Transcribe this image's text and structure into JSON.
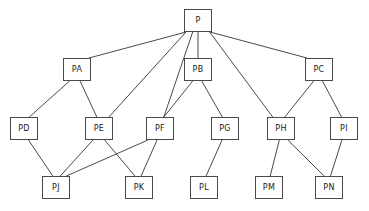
{
  "diagram": {
    "type": "node-link-graph",
    "title": "",
    "canvas": {
      "width": 369,
      "height": 211
    },
    "style": {
      "background_color": "#ffffff",
      "node_fill": "#ffffff",
      "node_stroke": "#4a4a4a",
      "edge_stroke": "#4a4a4a",
      "label_color": "#1a1a1a"
    },
    "nodes": [
      {
        "id": "P",
        "label": "P",
        "x": 184,
        "y": 9,
        "w": 28,
        "h": 23,
        "level": 0
      },
      {
        "id": "PA",
        "label": "PA",
        "x": 63,
        "y": 58,
        "w": 28,
        "h": 23,
        "level": 1
      },
      {
        "id": "PB",
        "label": "PB",
        "x": 184,
        "y": 58,
        "w": 28,
        "h": 23,
        "level": 1
      },
      {
        "id": "PC",
        "label": "PC",
        "x": 305,
        "y": 58,
        "w": 28,
        "h": 23,
        "level": 1
      },
      {
        "id": "PD",
        "label": "PD",
        "x": 10,
        "y": 117,
        "w": 28,
        "h": 23,
        "level": 2
      },
      {
        "id": "PE",
        "label": "PE",
        "x": 85,
        "y": 117,
        "w": 28,
        "h": 23,
        "level": 2
      },
      {
        "id": "PF",
        "label": "PF",
        "x": 146,
        "y": 117,
        "w": 28,
        "h": 23,
        "level": 2
      },
      {
        "id": "PG",
        "label": "PG",
        "x": 211,
        "y": 117,
        "w": 28,
        "h": 23,
        "level": 2
      },
      {
        "id": "PH",
        "label": "PH",
        "x": 267,
        "y": 117,
        "w": 28,
        "h": 23,
        "level": 2
      },
      {
        "id": "PI",
        "label": "PI",
        "x": 330,
        "y": 117,
        "w": 28,
        "h": 23,
        "level": 2
      },
      {
        "id": "PJ",
        "label": "PJ",
        "x": 42,
        "y": 176,
        "w": 28,
        "h": 23,
        "level": 3
      },
      {
        "id": "PK",
        "label": "PK",
        "x": 125,
        "y": 176,
        "w": 28,
        "h": 23,
        "level": 3
      },
      {
        "id": "PL",
        "label": "PL",
        "x": 190,
        "y": 176,
        "w": 28,
        "h": 23,
        "level": 3
      },
      {
        "id": "PM",
        "label": "PM",
        "x": 255,
        "y": 176,
        "w": 28,
        "h": 23,
        "level": 3
      },
      {
        "id": "PN",
        "label": "PN",
        "x": 315,
        "y": 176,
        "w": 28,
        "h": 23,
        "level": 3
      }
    ],
    "edges": [
      {
        "from": "P",
        "to": "PA"
      },
      {
        "from": "P",
        "to": "PE"
      },
      {
        "from": "P",
        "to": "PF"
      },
      {
        "from": "P",
        "to": "PB"
      },
      {
        "from": "P",
        "to": "PH"
      },
      {
        "from": "P",
        "to": "PC"
      },
      {
        "from": "PA",
        "to": "PD"
      },
      {
        "from": "PA",
        "to": "PE"
      },
      {
        "from": "PB",
        "to": "PF"
      },
      {
        "from": "PB",
        "to": "PG"
      },
      {
        "from": "PC",
        "to": "PH"
      },
      {
        "from": "PC",
        "to": "PI"
      },
      {
        "from": "PD",
        "to": "PJ"
      },
      {
        "from": "PE",
        "to": "PJ"
      },
      {
        "from": "PE",
        "to": "PK"
      },
      {
        "from": "PF",
        "to": "PJ"
      },
      {
        "from": "PF",
        "to": "PK"
      },
      {
        "from": "PG",
        "to": "PL"
      },
      {
        "from": "PH",
        "to": "PM"
      },
      {
        "from": "PH",
        "to": "PN"
      },
      {
        "from": "PI",
        "to": "PN"
      }
    ]
  }
}
